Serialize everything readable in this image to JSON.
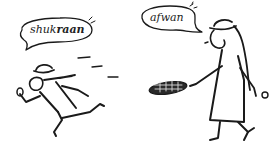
{
  "illustration": {
    "description": "Line-drawing cartoon: a man running away says 'shukraan' while a woman holding out a tray says 'afwan'",
    "left_bubble": {
      "text_regular": "shuk",
      "text_bold": "raan",
      "speaker": "running man"
    },
    "right_bubble": {
      "text": "afwan",
      "speaker": "woman with tray"
    },
    "ink_color": "#1a1a1a",
    "background_color": "#ffffff"
  }
}
